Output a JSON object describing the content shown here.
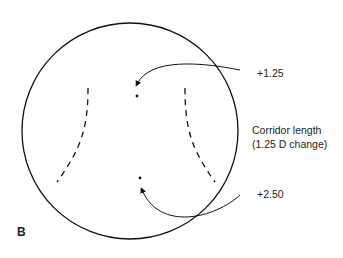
{
  "figure": {
    "panel_label": "B",
    "labels": {
      "top_power": "+1.25",
      "bottom_power": "+2.50",
      "corridor_line1": "Corridor length",
      "corridor_line2": "(1.25 D change)"
    }
  }
}
